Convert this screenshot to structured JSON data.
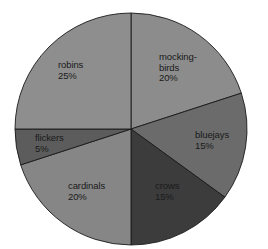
{
  "chart_data": {
    "type": "pie",
    "title": "",
    "start_angle_deg": 0,
    "direction": "clockwise",
    "slices": [
      {
        "name": "mocking-birds",
        "label_lines": [
          "mocking-",
          "birds",
          "20%"
        ],
        "value": 20,
        "color": "#8c8c8c"
      },
      {
        "name": "bluejays",
        "label_lines": [
          "bluejays",
          "15%"
        ],
        "value": 15,
        "color": "#6b6b6b"
      },
      {
        "name": "crows",
        "label_lines": [
          "crows",
          "15%"
        ],
        "value": 15,
        "color": "#3c3c3c"
      },
      {
        "name": "cardinals",
        "label_lines": [
          "cardinals",
          "20%"
        ],
        "value": 20,
        "color": "#868686"
      },
      {
        "name": "flickers",
        "label_lines": [
          "flickers",
          "5%"
        ],
        "value": 5,
        "color": "#5c5c5c"
      },
      {
        "name": "robins",
        "label_lines": [
          "robins",
          "25%"
        ],
        "value": 25,
        "color": "#8e8e8e"
      }
    ],
    "categories": [
      "mocking-birds",
      "bluejays",
      "crows",
      "cardinals",
      "flickers",
      "robins"
    ],
    "values": [
      20,
      15,
      15,
      20,
      5,
      25
    ],
    "unit": "%",
    "legend": "none (labels inside slices)"
  },
  "labels": {
    "mockingbirds": "mocking-\nbirds\n20%",
    "bluejays": "bluejays\n15%",
    "crows": "crows\n15%",
    "cardinals": "cardinals\n20%",
    "flickers": "flickers\n5%",
    "robins": "robins\n25%"
  }
}
